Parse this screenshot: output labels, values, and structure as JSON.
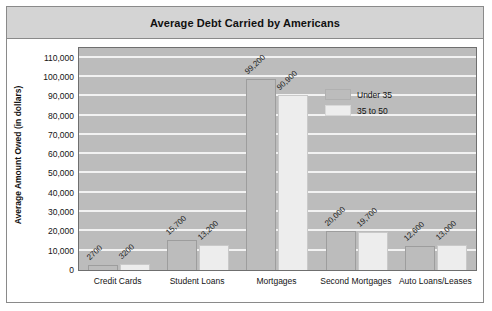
{
  "chart_data": {
    "type": "bar",
    "title": "Average Debt Carried by Americans",
    "xlabel": "",
    "ylabel": "Average Amount Owed (in dollars)",
    "categories": [
      "Credit Cards",
      "Student Loans",
      "Mortgages",
      "Second Mortgages",
      "Auto Loans/Leases"
    ],
    "series": [
      {
        "name": "Under 35",
        "values": [
          2700,
          15700,
          99200,
          20000,
          12600
        ],
        "labels": [
          "2700",
          "15,700",
          "99,200",
          "20,000",
          "12,600"
        ],
        "color": "#bcbcbc"
      },
      {
        "name": "35 to 50",
        "values": [
          3200,
          13200,
          90900,
          19700,
          13000
        ],
        "labels": [
          "3200",
          "13,200",
          "90,900",
          "19,700",
          "13,000"
        ],
        "color": "#ededed"
      }
    ],
    "ylim": [
      0,
      115000
    ],
    "yticks": [
      0,
      10000,
      20000,
      30000,
      40000,
      50000,
      60000,
      70000,
      80000,
      90000,
      100000,
      110000
    ],
    "ytick_labels": [
      "0",
      "10,000",
      "20,000",
      "30,000",
      "40,000",
      "50,000",
      "60,000",
      "70,000",
      "80,000",
      "90,000",
      "100,000",
      "110,000"
    ],
    "grid": true,
    "legend_position": "upper-right",
    "plot_background": "#bcbcbc",
    "gridline_color": "#f2f2f2",
    "title_band_color": "#d4d4d4"
  }
}
